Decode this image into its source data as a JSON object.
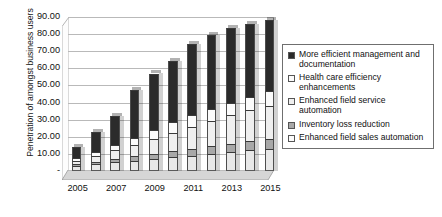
{
  "chart_data": {
    "type": "bar",
    "subtype": "stacked-column-3d",
    "title": "",
    "xlabel": "",
    "ylabel": "Penetration of amongst business users",
    "ylim": [
      0,
      90
    ],
    "ytick_step": 10,
    "ytick_labels": [
      "90.00",
      "80.00",
      "70.00",
      "60.00",
      "50.00",
      "40.00",
      "30.00",
      "20.00",
      "10.00",
      "-"
    ],
    "ytick_values": [
      90,
      80,
      70,
      60,
      50,
      40,
      30,
      20,
      10,
      0
    ],
    "grid": true,
    "grid_axis": "y",
    "legend_position": "right",
    "categories": [
      2005,
      2006,
      2007,
      2008,
      2009,
      2010,
      2011,
      2012,
      2013,
      2014,
      2015
    ],
    "xtick_labels": [
      "2005",
      "",
      "2007",
      "",
      "2009",
      "",
      "2011",
      "",
      "2013",
      "",
      "2015"
    ],
    "xtick_labels_visible": [
      "2005",
      "2007",
      "2009",
      "2011",
      "2013",
      "2015"
    ],
    "series": [
      {
        "name": "Enhanced field sales automation",
        "color": "#e8e8e8",
        "values": [
          3.0,
          4.0,
          5.0,
          6.0,
          7.0,
          8.0,
          9.0,
          10.0,
          11.0,
          12.0,
          13.0
        ]
      },
      {
        "name": "Inventory loss reduction",
        "color": "#a8a8a8",
        "values": [
          1.0,
          1.5,
          2.0,
          2.5,
          3.0,
          3.5,
          4.0,
          4.5,
          5.0,
          5.5,
          6.0
        ]
      },
      {
        "name": "Enhanced field service automation",
        "color": "#efefef",
        "values": [
          2.0,
          3.5,
          5.0,
          7.0,
          9.0,
          11.0,
          13.0,
          15.0,
          16.5,
          18.0,
          19.0
        ]
      },
      {
        "name": "Health care efficiency enhancements",
        "color": "#fbfbfb",
        "values": [
          1.5,
          2.0,
          3.0,
          4.0,
          5.0,
          6.0,
          6.5,
          7.0,
          7.5,
          8.0,
          8.5
        ]
      },
      {
        "name": "More efficient management and documentation",
        "color": "#2b2b2b",
        "values": [
          6.5,
          12.0,
          17.0,
          28.0,
          33.0,
          36.0,
          41.5,
          43.0,
          43.5,
          42.5,
          42.0
        ]
      }
    ],
    "totals": [
      14.0,
      23.0,
      32.0,
      47.5,
      57.0,
      64.5,
      74.0,
      79.5,
      83.5,
      86.0,
      88.5
    ],
    "legend_entries": [
      "More efficient management and documentation",
      "Health care efficiency enhancements",
      "Enhanced field service automation",
      "Inventory loss reduction",
      "Enhanced field sales automation"
    ],
    "legend_swatch_colors": [
      "#2b2b2b",
      "#fbfbfb",
      "#efefef",
      "#a8a8a8",
      "#fbfbfb"
    ]
  }
}
